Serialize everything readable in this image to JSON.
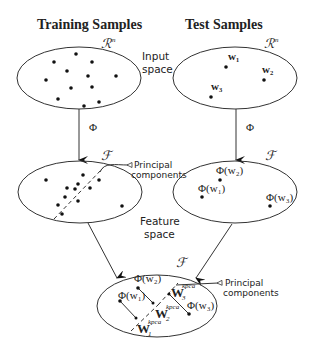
{
  "titles": {
    "left": "Training Samples",
    "right": "Test Samples"
  },
  "space_labels": {
    "input_line1": "Input",
    "input_line2": "space",
    "feature_line1": "Feature",
    "feature_line2": "space",
    "rn_left": "ℛn",
    "rn_right": "ℛn",
    "f_left": "ℱ",
    "f_right": "ℱ",
    "f_bottom": "ℱ"
  },
  "mapping": {
    "phi_left": "Φ",
    "phi_right": "Φ"
  },
  "annotations": {
    "pc_mid_line1": "Principal",
    "pc_mid_line2": "components",
    "pc_bottom_line1": "Principal",
    "pc_bottom_line2": "components"
  },
  "test_points": {
    "w1": "w₁",
    "w2": "w₂",
    "w3": "w₃"
  },
  "feature_test_points": {
    "phi_w1": "Φ(w₁)",
    "phi_w2": "Φ(w₂)",
    "phi_w3": "Φ(w₃)"
  },
  "bottom_points": {
    "phi_w1": "Φ(w₁)",
    "phi_w2": "Φ(w₂)",
    "phi_w3": "Φ(w₃)"
  },
  "projections": {
    "W1_base": "W",
    "W1_sub": "1",
    "W1_sup": "kpca",
    "W2_base": "W",
    "W2_sub": "2",
    "W2_sup": "kpca",
    "W3_base": "W",
    "W3_sub": "3",
    "W3_sup": "kpca"
  }
}
